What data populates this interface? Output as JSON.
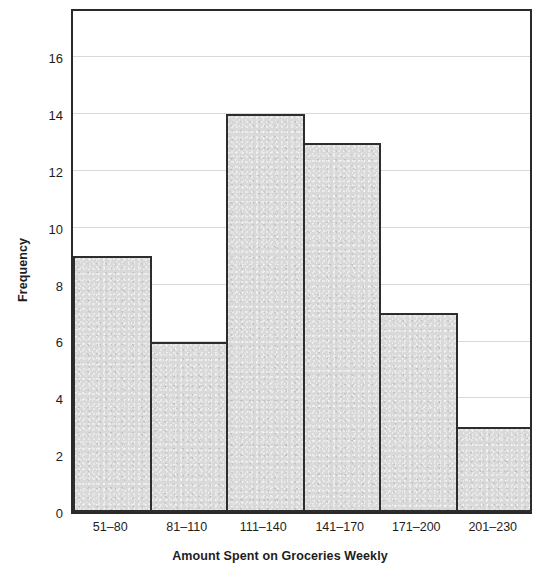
{
  "chart_data": {
    "type": "bar",
    "title": "",
    "subtitle": "",
    "xlabel": "Amount Spent on Groceries Weekly",
    "ylabel": "Frequency",
    "categories": [
      "51–80",
      "81–110",
      "111–140",
      "141–170",
      "171–200",
      "201–230"
    ],
    "values": [
      9,
      6,
      14,
      13,
      7,
      3
    ],
    "series": [
      {
        "name": "Frequency",
        "values": [
          9,
          6,
          14,
          13,
          7,
          3
        ]
      }
    ],
    "ylim": [
      0,
      17.7
    ],
    "xlim": [
      0,
      6
    ],
    "yticks": [
      0,
      2,
      4,
      6,
      8,
      10,
      12,
      14,
      16
    ],
    "ytick_labels": [
      "0",
      "2",
      "4",
      "6",
      "8",
      "10",
      "12",
      "14",
      "16"
    ],
    "xtick_labels": [
      "51–80",
      "81–110",
      "111–140",
      "141–170",
      "171–200",
      "201–230"
    ],
    "grid": true,
    "grid_axis": "y",
    "legend": false,
    "legend_position": "none",
    "bar_fill_color": "#d9d9d9",
    "bar_edge_color": "#2d2d2d",
    "grid_color": "#d9d9d9",
    "axis_color": "#2a2a2a",
    "text_color": "#1d1d1d",
    "background_color": "#ffffff",
    "annotations": []
  }
}
